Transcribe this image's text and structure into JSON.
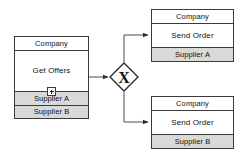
{
  "diagram": {
    "type": "bpmn-collaboration",
    "colors": {
      "stroke": "#3a3a3a",
      "lane_fill": "#d9d9d9",
      "pool_fill": "#ffffff",
      "text": "#111111",
      "connector": "#4a4a4a"
    }
  },
  "pools": {
    "source": {
      "name": "source-pool",
      "header": "Company",
      "task": "Get Offers",
      "task_marker": "plus-collapsed-subprocess-icon",
      "lanes": [
        {
          "label": "Supplier A"
        },
        {
          "label": "Supplier B"
        }
      ]
    },
    "branch_a": {
      "name": "supplier-a-pool",
      "header": "Company",
      "task": "Send Order",
      "lanes": [
        {
          "label": "Supplier A"
        }
      ]
    },
    "branch_b": {
      "name": "supplier-b-pool",
      "header": "Company",
      "task": "Send Order",
      "lanes": [
        {
          "label": "Supplier B"
        }
      ]
    }
  },
  "gateway": {
    "name": "exclusive-gateway",
    "glyph": "X",
    "label": ""
  },
  "flows": [
    {
      "name": "flow-get-offers-to-gateway",
      "from": "Get Offers",
      "to": "exclusive-gateway"
    },
    {
      "name": "flow-gateway-to-supplier-a",
      "from": "exclusive-gateway",
      "to": "Send Order (Supplier A)"
    },
    {
      "name": "flow-gateway-to-supplier-b",
      "from": "exclusive-gateway",
      "to": "Send Order (Supplier B)"
    }
  ]
}
